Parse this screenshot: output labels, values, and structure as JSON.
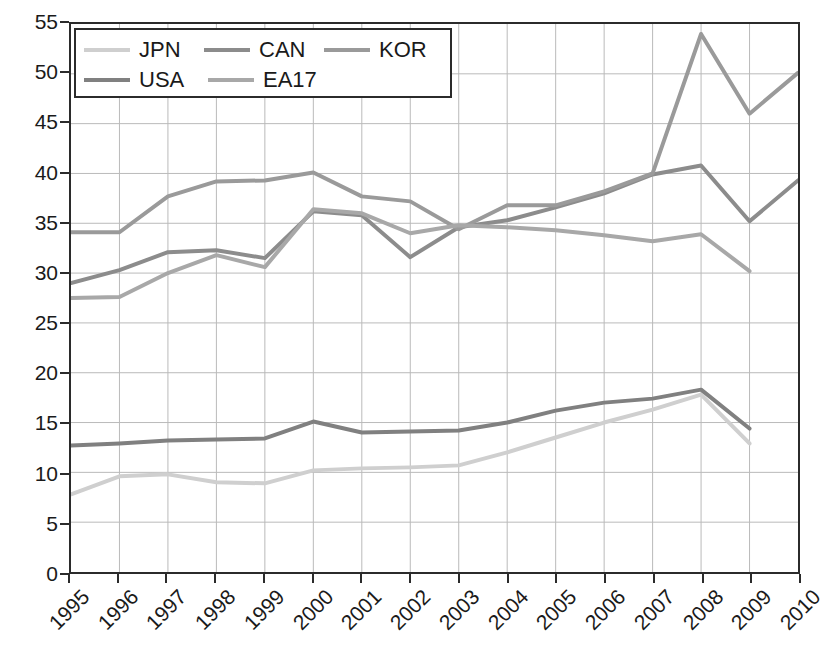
{
  "chart_data": {
    "type": "line",
    "title": "",
    "xlabel": "",
    "ylabel": "",
    "x": [
      1995,
      1996,
      1997,
      1998,
      1999,
      2000,
      2001,
      2002,
      2003,
      2004,
      2005,
      2006,
      2007,
      2008,
      2009,
      2010
    ],
    "xtick_labels": [
      "1995",
      "1996",
      "1997",
      "1998",
      "1999",
      "2000",
      "2001",
      "2002",
      "2003",
      "2004",
      "2005",
      "2006",
      "2007",
      "2008",
      "2009",
      "2010"
    ],
    "ytick_labels": [
      "0",
      "5",
      "10",
      "15",
      "20",
      "25",
      "30",
      "35",
      "40",
      "45",
      "50",
      "55"
    ],
    "yticks": [
      0,
      5,
      10,
      15,
      20,
      25,
      30,
      35,
      40,
      45,
      50,
      55
    ],
    "ylim": [
      0,
      55
    ],
    "xlim": [
      1995,
      2010
    ],
    "grid": true,
    "legend_position": "upper-left-inside",
    "series": [
      {
        "name": "JPN",
        "color": "#cfcfcf",
        "values": [
          7.8,
          9.6,
          9.8,
          9.0,
          8.9,
          10.2,
          10.4,
          10.5,
          10.7,
          12.0,
          13.5,
          15.0,
          16.3,
          17.8,
          12.9,
          null
        ]
      },
      {
        "name": "CAN",
        "color": "#8c8c8c",
        "values": [
          29.0,
          30.3,
          32.1,
          32.3,
          31.5,
          36.2,
          35.8,
          31.6,
          34.6,
          35.3,
          36.6,
          38.0,
          39.9,
          40.8,
          35.2,
          39.3
        ]
      },
      {
        "name": "KOR",
        "color": "#9a9a9a",
        "values": [
          34.1,
          34.1,
          37.7,
          39.2,
          39.3,
          40.1,
          37.7,
          37.2,
          34.4,
          36.8,
          36.8,
          38.2,
          40.0,
          54.0,
          46.0,
          50.1
        ]
      },
      {
        "name": "USA",
        "color": "#808080",
        "values": [
          12.7,
          12.9,
          13.2,
          13.3,
          13.4,
          15.1,
          14.0,
          14.1,
          14.2,
          15.0,
          16.2,
          17.0,
          17.4,
          18.3,
          14.4,
          null
        ]
      },
      {
        "name": "EA17",
        "color": "#a8a8a8",
        "values": [
          27.5,
          27.6,
          30.0,
          31.8,
          30.6,
          36.4,
          36.0,
          34.0,
          34.8,
          34.6,
          34.3,
          33.8,
          33.2,
          33.9,
          30.2,
          null
        ]
      }
    ]
  },
  "legend": {
    "rows": [
      [
        {
          "label": "JPN",
          "color": "#cfcfcf"
        },
        {
          "label": "CAN",
          "color": "#8c8c8c"
        },
        {
          "label": "KOR",
          "color": "#9a9a9a"
        }
      ],
      [
        {
          "label": "USA",
          "color": "#808080"
        },
        {
          "label": "EA17",
          "color": "#a8a8a8"
        }
      ]
    ]
  },
  "style": {
    "axis_color": "#2b2b2b",
    "grid_color": "#b9b9b9",
    "background": "#ffffff",
    "text_color": "#1a1a1a"
  }
}
